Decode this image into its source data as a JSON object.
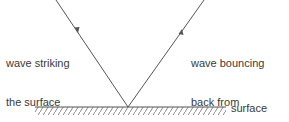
{
  "diagram": {
    "labels": {
      "incident": [
        "wave striking",
        "the surface"
      ],
      "reflected": [
        "wave bouncing",
        "back from",
        "the surface"
      ],
      "surface": "surface"
    },
    "colors": {
      "line": "#555555",
      "hatch": "#8a8a8a",
      "text": "#3a3a3a"
    }
  }
}
